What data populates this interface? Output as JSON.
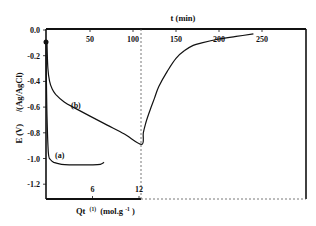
{
  "chart_data": {
    "type": "line",
    "title": "",
    "top_xlabel": "t (min)",
    "bottom_xlabel": "Qt (1) (mol.g-1)",
    "ylabel": "E (V) /(Ag/AgCl)",
    "ylim": [
      -1.32,
      0.0
    ],
    "yticks": [
      0.0,
      -0.2,
      -0.4,
      -0.6,
      -0.8,
      -1.0,
      -1.2
    ],
    "ytick_labels": [
      "0.0",
      "-0.2",
      "-0.4",
      "-0.6",
      "-0.8",
      "-1.0",
      "-1.2"
    ],
    "top_xlim": [
      0,
      300
    ],
    "top_xticks": [
      50,
      100,
      150,
      200,
      250
    ],
    "top_xtick_labels": [
      "50",
      "100",
      "150",
      "200",
      "250"
    ],
    "bottom_xlim": [
      0,
      12.3
    ],
    "bottom_xticks": [
      6,
      12
    ],
    "bottom_xtick_labels": [
      "6",
      "12"
    ],
    "grid": false,
    "legend": "inline labels",
    "annotations": [
      {
        "text": "(a)",
        "note": "curve a, plotted vs Qt"
      },
      {
        "text": "(b)",
        "note": "curve b, plotted vs t"
      },
      {
        "text": "dashed line",
        "note": "vertical dashed line at t ≈ 110 min / Qt ≈ 12.3, continues as horizontal dashed baseline"
      }
    ],
    "series": [
      {
        "name": "(a)",
        "x_axis": "Qt (mol.g-1)",
        "x": [
          0.0,
          0.1,
          0.3,
          0.6,
          1.0,
          2.0,
          3.0,
          4.0,
          5.0,
          6.0,
          7.0,
          7.5
        ],
        "y": [
          -0.1,
          -0.6,
          -0.95,
          -1.01,
          -1.03,
          -1.045,
          -1.05,
          -1.05,
          -1.05,
          -1.05,
          -1.045,
          -1.03
        ]
      },
      {
        "name": "(b)",
        "x_axis": "t (min)",
        "x": [
          0,
          1,
          3,
          6,
          10,
          20,
          33,
          50,
          70,
          90,
          110,
          112,
          115,
          120,
          125,
          130,
          140,
          150,
          160,
          170,
          180,
          200,
          220,
          240
        ],
        "y": [
          -0.1,
          -0.3,
          -0.4,
          -0.46,
          -0.5,
          -0.56,
          -0.61,
          -0.67,
          -0.74,
          -0.81,
          -0.89,
          -0.8,
          -0.72,
          -0.62,
          -0.53,
          -0.44,
          -0.32,
          -0.22,
          -0.16,
          -0.12,
          -0.1,
          -0.07,
          -0.05,
          -0.03
        ]
      }
    ]
  },
  "labels": {
    "y_axis_title_a": "E (V)",
    "y_axis_title_b": "/(Ag/AgCl)",
    "top_axis_title": "t (min)",
    "bottom_axis_title": "Qt",
    "bottom_axis_superscript": "(1)",
    "bottom_axis_unit": "(mol.g",
    "bottom_axis_unit_sup": "-1",
    "bottom_axis_unit_close": ")",
    "curve_a": "(a)",
    "curve_b": "(b)"
  },
  "colors": {
    "axis": "#111111",
    "curve": "#111111",
    "dashed": "#555555",
    "background": "#ffffff"
  }
}
